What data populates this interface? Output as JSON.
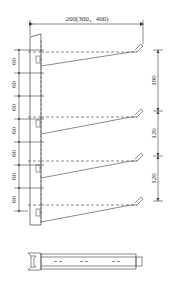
{
  "drawing": {
    "title": "Cable bracket elevation and plan view",
    "line_color": "#3a3a3a",
    "top_dimension": {
      "label": "200(300、400)"
    },
    "left_dimensions": {
      "labels": [
        "60",
        "60",
        "60",
        "60",
        "60",
        "60",
        "60"
      ]
    },
    "right_dimensions": {
      "labels": [
        "180",
        "120",
        "120"
      ]
    },
    "arm_count": 4
  }
}
